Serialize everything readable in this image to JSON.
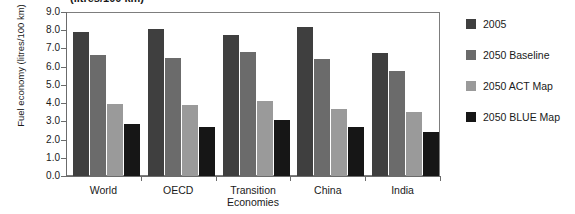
{
  "title_partial": "(litres/100 km)",
  "chart_data": {
    "type": "bar",
    "title": "(litres/100 km)",
    "xlabel": "",
    "ylabel": "Fuel economy (litres/100 km)",
    "ylim": [
      0.0,
      9.0
    ],
    "ytick_labels": [
      "9.0",
      "8.0",
      "7.0",
      "6.0",
      "5.0",
      "4.0",
      "3.0",
      "2.0",
      "1.0",
      "0.0"
    ],
    "ytick_values": [
      9.0,
      8.0,
      7.0,
      6.0,
      5.0,
      4.0,
      3.0,
      2.0,
      1.0,
      0.0
    ],
    "grid": false,
    "legend_position": "right",
    "categories": [
      "World",
      "OECD",
      "Transition Economies",
      "China",
      "India"
    ],
    "series": [
      {
        "name": "2005",
        "color": "#3f3f3f",
        "values": [
          7.9,
          8.05,
          7.75,
          8.2,
          6.75
        ]
      },
      {
        "name": "2050 Baseline",
        "color": "#6b6b6b",
        "values": [
          6.65,
          6.5,
          6.8,
          6.4,
          5.75
        ]
      },
      {
        "name": "2050 ACT Map",
        "color": "#9a9a9a",
        "values": [
          3.95,
          3.9,
          4.1,
          3.7,
          3.5
        ]
      },
      {
        "name": "2050 BLUE Map",
        "color": "#161616",
        "values": [
          2.85,
          2.7,
          3.1,
          2.7,
          2.4
        ]
      }
    ]
  },
  "legend": {
    "items": [
      {
        "label": "2005"
      },
      {
        "label": "2050 Baseline"
      },
      {
        "label": "2050 ACT Map"
      },
      {
        "label": "2050 BLUE Map"
      }
    ]
  }
}
